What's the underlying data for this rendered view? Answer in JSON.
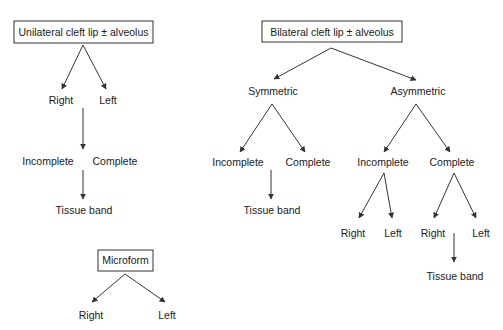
{
  "diagram": {
    "colors": {
      "line": "#333333",
      "text": "#1a1a1a",
      "background": "#ffffff"
    },
    "unilateral": {
      "root": "Unilateral cleft lip ± alveolus",
      "side": [
        "Right",
        "Left"
      ],
      "extent": [
        "Incomplete",
        "Complete"
      ],
      "sub": "Tissue band"
    },
    "bilateral": {
      "root": "Bilateral cleft lip ± alveolus",
      "symmetric": {
        "label": "Symmetric",
        "extent": [
          "Incomplete",
          "Complete"
        ],
        "sub": "Tissue band"
      },
      "asymmetric": {
        "label": "Asymmetric",
        "incomplete": {
          "label": "Incomplete",
          "side": [
            "Right",
            "Left"
          ]
        },
        "complete": {
          "label": "Complete",
          "side": [
            "Right",
            "Left"
          ],
          "sub": "Tissue band"
        }
      }
    },
    "microform": {
      "root": "Microform",
      "side": [
        "Right",
        "Left"
      ]
    }
  }
}
